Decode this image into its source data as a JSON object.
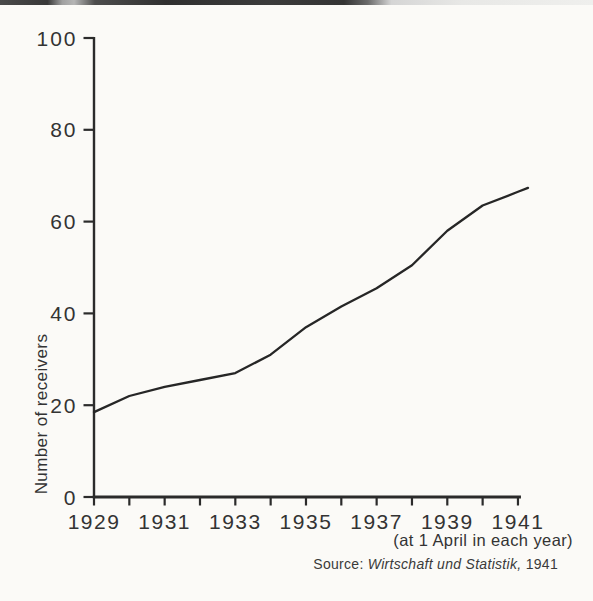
{
  "chart_data": {
    "type": "line",
    "title": "",
    "ylabel": "Number of receivers",
    "xlabel": "",
    "x_axis_note": "(at 1 April in each year)",
    "x": [
      1929,
      1930,
      1931,
      1932,
      1933,
      1934,
      1935,
      1936,
      1937,
      1938,
      1939,
      1940,
      1941
    ],
    "values": [
      18.5,
      22,
      24,
      25.5,
      27,
      31,
      37,
      41.5,
      45.5,
      50.5,
      58,
      63.5,
      66.5
    ],
    "y_ticks": [
      0,
      20,
      40,
      60,
      80,
      100
    ],
    "x_label_years": [
      1929,
      1931,
      1933,
      1935,
      1937,
      1939,
      1941
    ],
    "ylim": [
      0,
      100
    ],
    "xlim": [
      1929,
      1941
    ],
    "grid": false,
    "legend_position": "none",
    "colors": {
      "line": "#262626",
      "axis": "#2b2b2b",
      "tick_text": "#333333",
      "background": "#fbfaf7",
      "scan_band": "#3a3a3a"
    }
  },
  "source": {
    "prefix": "Source: ",
    "journal": "Wirtschaft und Statistik,",
    "suffix": " 1941"
  }
}
